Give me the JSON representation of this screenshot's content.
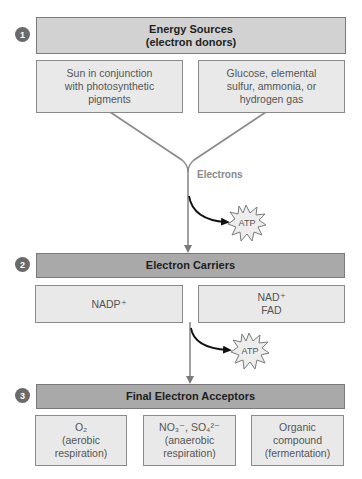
{
  "steps": [
    {
      "number": "1",
      "title_lines": [
        "Energy Sources",
        "(electron donors)"
      ],
      "boxes": [
        {
          "lines": [
            "Sun in conjunction",
            "with photosynthetic",
            "pigments"
          ]
        },
        {
          "lines": [
            "Glucose, elemental",
            "sulfur, ammonia, or",
            "hydrogen gas"
          ]
        }
      ]
    },
    {
      "number": "2",
      "title_lines": [
        "Electron Carriers"
      ],
      "boxes": [
        {
          "lines": [
            "NADP⁺"
          ]
        },
        {
          "lines": [
            "NAD⁺",
            "FAD"
          ]
        }
      ]
    },
    {
      "number": "3",
      "title_lines": [
        "Final Electron Acceptors"
      ],
      "boxes": [
        {
          "lines": [
            "O₂",
            "(aerobic",
            "respiration)"
          ]
        },
        {
          "lines": [
            "NO₃⁻, SO₄²⁻",
            "(anaerobic",
            "respiration)"
          ]
        },
        {
          "lines": [
            "Organic",
            "compound",
            "(fermentation)"
          ]
        }
      ]
    }
  ],
  "flow": {
    "electrons_label": "Electrons",
    "atp_label_1": "ATP",
    "atp_label_2": "ATP"
  },
  "colors": {
    "header_light": "#d2d2d2",
    "header_dark": "#a9a9a9",
    "box_fill": "#e9e9e9",
    "line_gray": "#8a8a8a",
    "arrow_black": "#111111"
  }
}
